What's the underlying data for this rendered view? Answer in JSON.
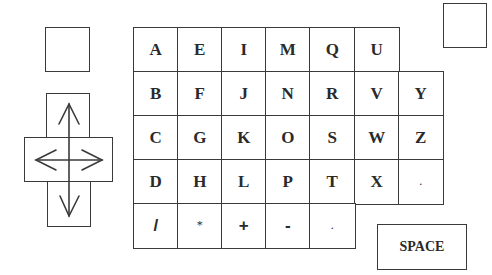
{
  "keyboard": {
    "rows": [
      [
        "A",
        "E",
        "I",
        "M",
        "Q",
        "U",
        null
      ],
      [
        "B",
        "F",
        "J",
        "N",
        "R",
        "V",
        "Y"
      ],
      [
        "C",
        "G",
        "K",
        "O",
        "S",
        "W",
        "Z"
      ],
      [
        "D",
        "H",
        "L",
        "P",
        "T",
        "X",
        "."
      ],
      [
        "/",
        "*",
        "+",
        "-",
        ".",
        null,
        null
      ]
    ]
  },
  "space_key": {
    "label": "SPACE"
  },
  "dpad": {
    "directions": [
      "up",
      "down",
      "left",
      "right"
    ]
  },
  "blank_keys": [
    "top-left-blank-key",
    "top-right-blank-key"
  ],
  "colors": {
    "line": "#3a3a3a",
    "text": "#2a2a2a",
    "background": "#ffffff"
  }
}
